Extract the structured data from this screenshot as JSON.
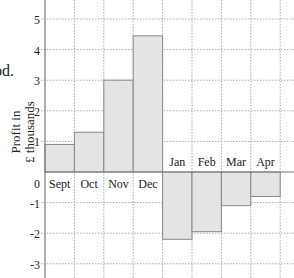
{
  "page": {
    "fragment_text": "od."
  },
  "chart_data": {
    "type": "bar",
    "title": "",
    "xlabel": "",
    "ylabel": "Profit in £ thousands",
    "ylabel_lines": [
      "Profit in",
      "£ thousands"
    ],
    "categories": [
      "Sept",
      "Oct",
      "Nov",
      "Dec",
      "Jan",
      "Feb",
      "Mar",
      "Apr"
    ],
    "values": [
      0.9,
      1.3,
      3.0,
      4.45,
      -2.2,
      -1.95,
      -1.1,
      -0.8
    ],
    "ylim": [
      -3.5,
      5.5
    ],
    "yticks": [
      5,
      4,
      3,
      2,
      1,
      0,
      -1,
      -2,
      -3
    ],
    "ytick_labels": [
      "5",
      "4",
      "3",
      "2",
      "1",
      "0",
      "-1",
      "-2",
      "-3"
    ],
    "grid": true,
    "legend": null,
    "colors": {
      "bar_fill": "#e4e4e4",
      "bar_stroke": "#888888",
      "grid": "#aaaaaa",
      "axis": "#777777"
    }
  }
}
